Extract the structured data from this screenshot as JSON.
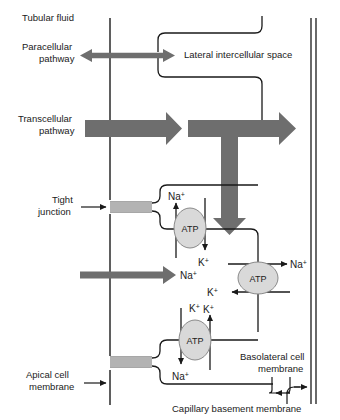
{
  "figure": {
    "type": "biological-diagram",
    "background_color": "#ffffff",
    "line_color": "#1a1a1a",
    "arrow_gray": "#6e6e6e",
    "tight_junction_gray": "#b3b3b3",
    "atp_fill": "#d9d9d9"
  },
  "labels": {
    "tubular_fluid": "Tubular fluid",
    "paracellular_pathway_line1": "Paracellular",
    "paracellular_pathway_line2": "pathway",
    "lateral_intercellular_space": "Lateral intercellular space",
    "transcellular_pathway_line1": "Transcellular",
    "transcellular_pathway_line2": "pathway",
    "tight_junction_line1": "Tight",
    "tight_junction_line2": "junction",
    "apical_cell_membrane_line1": "Apical cell",
    "apical_cell_membrane_line2": "membrane",
    "basolateral_cell_membrane_line1": "Basolateral cell",
    "basolateral_cell_membrane_line2": "membrane",
    "capillary_basement_membrane": "Capillary basement membrane"
  },
  "pumps": [
    {
      "id": "atp-pump-apical-upper",
      "label": "ATP"
    },
    {
      "id": "atp-pump-basolateral",
      "label": "ATP"
    },
    {
      "id": "atp-pump-apical-lower",
      "label": "ATP"
    }
  ],
  "ions": {
    "na_base": "Na",
    "na_charge": "+",
    "k_base": "K",
    "k_charge": "+",
    "instances": [
      {
        "id": "na-apical-upper-out",
        "element": "Na",
        "charge": "+"
      },
      {
        "id": "k-apical-upper-in",
        "element": "K",
        "charge": "+"
      },
      {
        "id": "na-paracellular-mid",
        "element": "Na",
        "charge": "+"
      },
      {
        "id": "na-basolateral-out",
        "element": "Na",
        "charge": "+"
      },
      {
        "id": "k-basolateral-in",
        "element": "K",
        "charge": "+"
      },
      {
        "id": "k-apical-lower-cytosol",
        "element": "K",
        "charge": "+"
      },
      {
        "id": "k-apical-lower-out",
        "element": "K",
        "charge": "+"
      },
      {
        "id": "na-apical-lower-in",
        "element": "Na",
        "charge": "+"
      }
    ]
  }
}
